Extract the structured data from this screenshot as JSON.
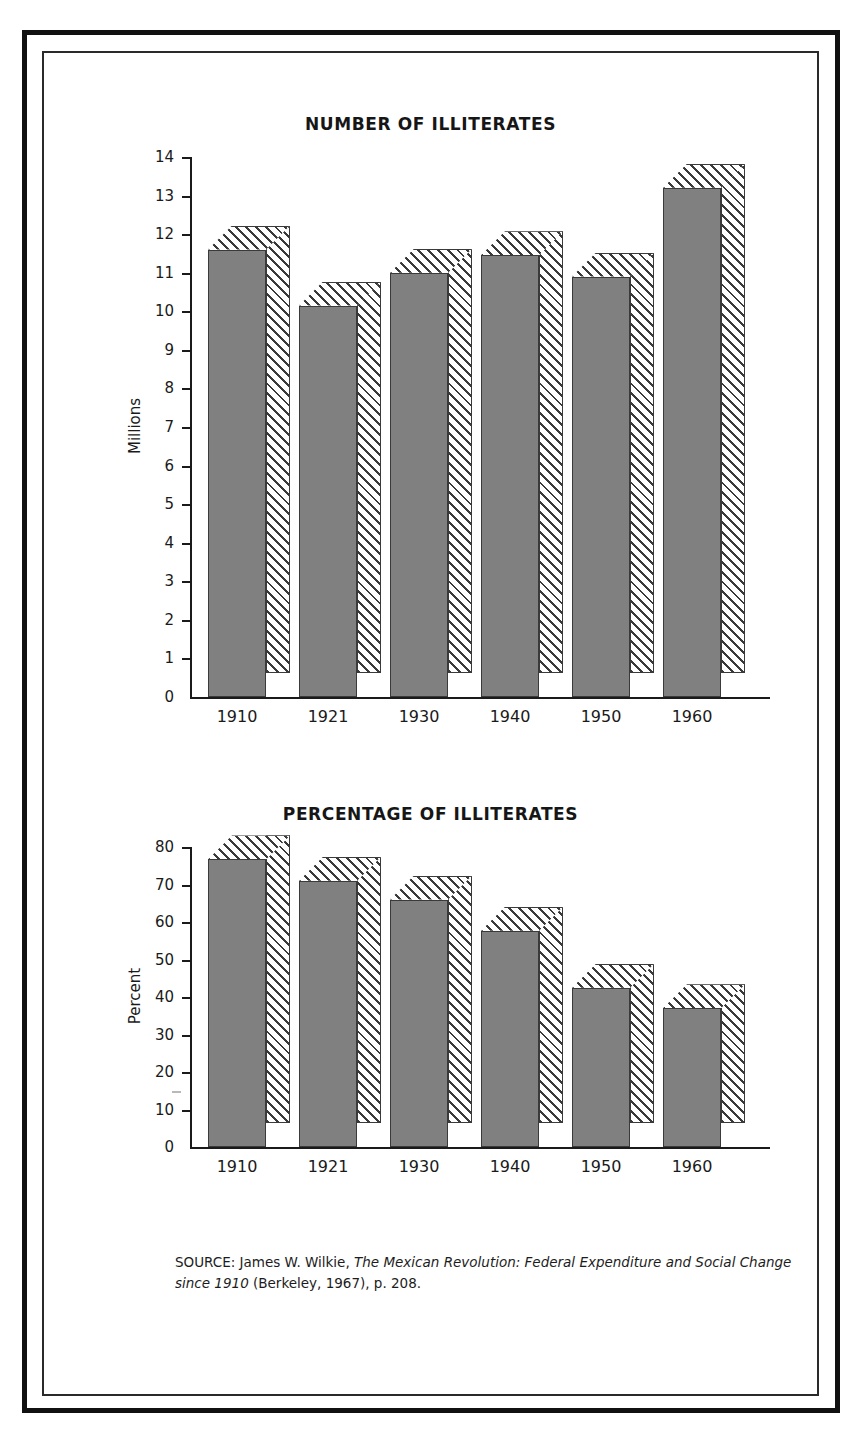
{
  "page": {
    "scan_header_fragment": "",
    "background_color": "#ffffff",
    "frame_color": "#111111"
  },
  "source_note": {
    "prefix": "SOURCE: James W. Wilkie, ",
    "title_italic": "The Mexican Revolution: Federal Expenditure and Social Change since 1910",
    "suffix": " (Berkeley, 1967), p. 208."
  },
  "chart_data": [
    {
      "type": "bar",
      "id": "number-of-illiterates",
      "title": "NUMBER OF ILLITERATES",
      "xlabel": "",
      "ylabel": "Millions",
      "categories": [
        "1910",
        "1921",
        "1930",
        "1940",
        "1950",
        "1960"
      ],
      "values": [
        11.6,
        10.15,
        11.0,
        11.45,
        10.9,
        13.2
      ],
      "ylim": [
        0,
        14
      ],
      "yticks": [
        0,
        1,
        2,
        3,
        4,
        5,
        6,
        7,
        8,
        9,
        10,
        11,
        12,
        13,
        14
      ],
      "ytick_labels": [
        "0",
        "1",
        "2",
        "3",
        "4",
        "5",
        "6",
        "7",
        "8",
        "9",
        "10",
        "11",
        "12",
        "13",
        "14"
      ],
      "grid": false,
      "legend": null,
      "bar_style": {
        "front_fill": "#808080",
        "side_fill_hatch": "#3a3a3a",
        "outline": "#3a3a3a",
        "three_d": true
      }
    },
    {
      "type": "bar",
      "id": "percentage-of-illiterates",
      "title": "PERCENTAGE OF ILLITERATES",
      "xlabel": "",
      "ylabel": "Percent",
      "categories": [
        "1910",
        "1921",
        "1930",
        "1940",
        "1950",
        "1960"
      ],
      "values": [
        76.7,
        71.0,
        66.0,
        57.7,
        42.5,
        37.0
      ],
      "ylim": [
        0,
        80
      ],
      "yticks": [
        0,
        10,
        20,
        30,
        40,
        50,
        60,
        70,
        80
      ],
      "ytick_labels": [
        "0",
        "10",
        "20",
        "30",
        "40",
        "50",
        "60",
        "70",
        "80"
      ],
      "grid": false,
      "legend": null,
      "bar_style": {
        "front_fill": "#808080",
        "side_fill_hatch": "#3a3a3a",
        "outline": "#3a3a3a",
        "three_d": true
      }
    }
  ]
}
